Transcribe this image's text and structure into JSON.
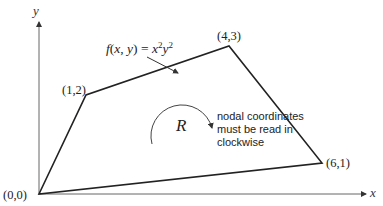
{
  "axes": {
    "x_label": "x",
    "y_label": "y"
  },
  "vertices": [
    {
      "label": "(0,0)",
      "x": 0,
      "y": 0
    },
    {
      "label": "(1,2)",
      "x": 1,
      "y": 2
    },
    {
      "label": "(4,3)",
      "x": 4,
      "y": 3
    },
    {
      "label": "(6,1)",
      "x": 6,
      "y": 1
    }
  ],
  "function_label": "f(x, y) = x²y²",
  "region_label": "R",
  "note": {
    "line1": "nodal coordinates",
    "line2": "must be read in",
    "line3": "clockwise"
  },
  "colors": {
    "line": "#222222",
    "axis": "#555555",
    "text": "#222222"
  }
}
